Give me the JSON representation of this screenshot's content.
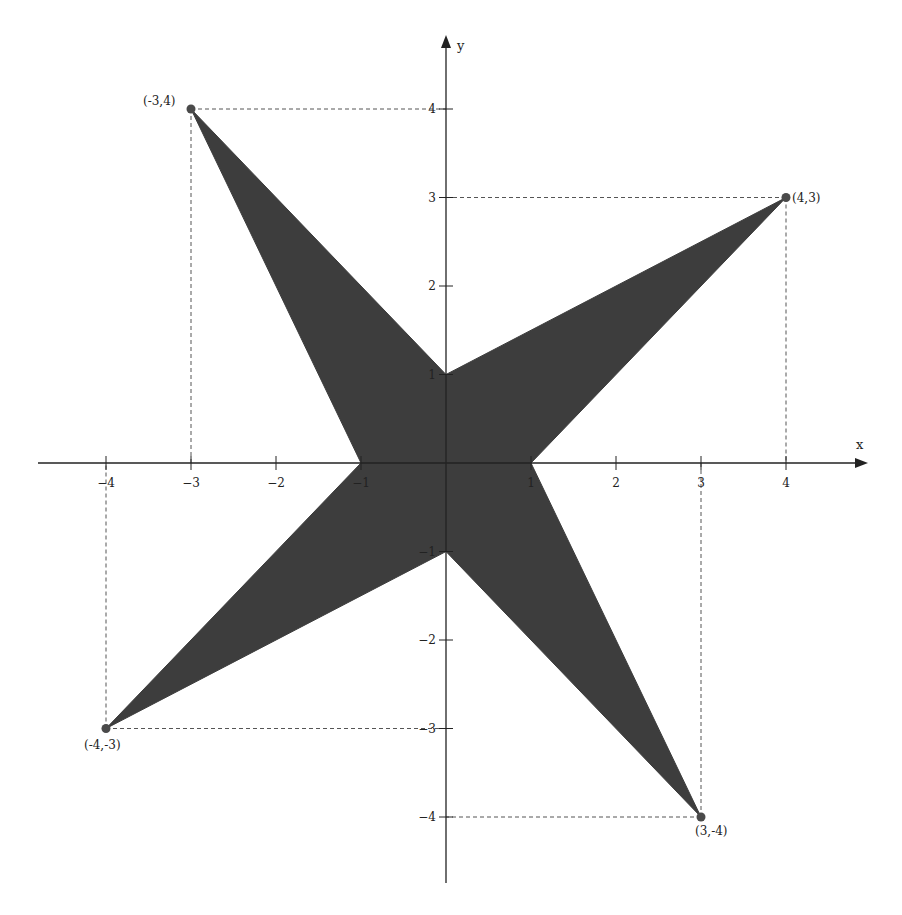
{
  "chart_data": {
    "type": "diagram",
    "title": "",
    "xlabel": "x",
    "ylabel": "y",
    "xlim": [
      -4.8,
      4.9
    ],
    "ylim": [
      -4.8,
      4.8
    ],
    "grid": false,
    "x_ticks": [
      -4,
      -3,
      -2,
      -1,
      1,
      2,
      3,
      4
    ],
    "y_ticks": [
      4,
      3,
      2,
      1,
      -1,
      -2,
      -3,
      -4
    ],
    "polygon": {
      "name": "four-pointed-star",
      "fill": "#3d3d3d",
      "vertices": [
        [
          -3,
          4
        ],
        [
          0,
          1
        ],
        [
          4,
          3
        ],
        [
          1,
          0
        ],
        [
          3,
          -4
        ],
        [
          0,
          -1
        ],
        [
          -4,
          -3
        ],
        [
          -1,
          0
        ]
      ]
    },
    "points": [
      {
        "x": -3,
        "y": 4,
        "label": "(-3,4)"
      },
      {
        "x": 4,
        "y": 3,
        "label": "(4,3)"
      },
      {
        "x": 3,
        "y": -4,
        "label": "(3,-4)"
      },
      {
        "x": -4,
        "y": -3,
        "label": "(-4,-3)"
      }
    ],
    "dashed_guides": true
  },
  "colors": {
    "fill": "#3d3d3d",
    "axis": "#222222",
    "point": "#4a4a4a",
    "guide": "#555555"
  },
  "layout": {
    "origin_px": [
      446,
      463
    ],
    "unit_x_px": 85,
    "unit_y_px": 88.5,
    "x_axis_px": [
      38,
      868
    ],
    "y_axis_px": [
      35,
      883
    ]
  }
}
